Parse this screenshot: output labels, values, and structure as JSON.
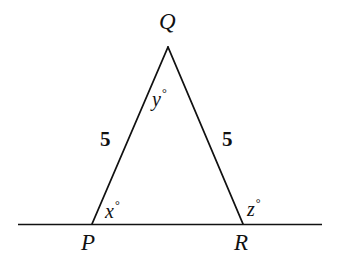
{
  "figure": {
    "kind": "geometry-diagram",
    "background_color": "#ffffff",
    "stroke_color": "#111111",
    "text_color": "#111111"
  },
  "labels": {
    "apex_vertex": "Q",
    "left_vertex": "P",
    "right_vertex": "R",
    "left_side_length": "5",
    "right_side_length": "5",
    "apex_angle": "y",
    "left_angle": "x",
    "right_angle": "z",
    "degree_symbol": "°"
  },
  "geometry": {
    "apex": {
      "x": 168,
      "y": 47
    },
    "left_base_vertex": {
      "x": 92,
      "y": 224
    },
    "right_base_vertex": {
      "x": 243,
      "y": 224
    },
    "baseline_start": {
      "x": 18,
      "y": 224
    },
    "baseline_end": {
      "x": 322,
      "y": 224
    },
    "stroke_width": 1.8
  },
  "chart_data": {
    "type": "diagram",
    "title": "",
    "shape": "isosceles triangle on a straight line",
    "vertices": [
      {
        "name": "Q",
        "x": 168,
        "y": 47,
        "role": "apex"
      },
      {
        "name": "P",
        "x": 92,
        "y": 224,
        "role": "base-left"
      },
      {
        "name": "R",
        "x": 243,
        "y": 224,
        "role": "base-right"
      }
    ],
    "segments": [
      {
        "from": "P",
        "to": "Q",
        "length_label": "5"
      },
      {
        "from": "Q",
        "to": "R",
        "length_label": "5"
      },
      {
        "from": "baseline_start",
        "to": "baseline_end",
        "length_label": ""
      }
    ],
    "angles": [
      {
        "at": "Q",
        "label": "y°",
        "type": "interior"
      },
      {
        "at": "P",
        "label": "x°",
        "type": "interior"
      },
      {
        "at": "R",
        "label": "z°",
        "type": "exterior"
      }
    ]
  }
}
